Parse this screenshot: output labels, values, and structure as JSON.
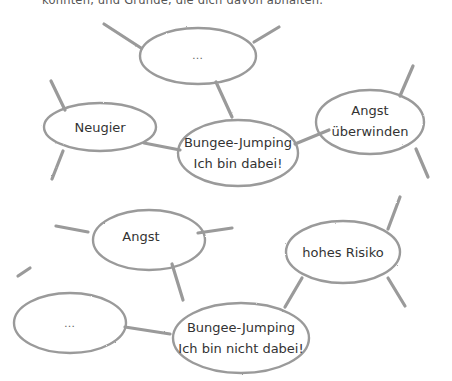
{
  "intro_text": "könnten, und Gründe, die dich davon abhalten.",
  "stroke_color": "#9a9a9a",
  "diagrams": [
    {
      "name": "dabei",
      "center": {
        "id": "center-1",
        "lines": [
          "Bungee-Jumping",
          "Ich bin dabei!"
        ]
      },
      "nodes": [
        {
          "id": "top",
          "text": "…"
        },
        {
          "id": "left",
          "text": "Neugier"
        },
        {
          "id": "right",
          "lines": [
            "Angst",
            "überwinden"
          ]
        }
      ]
    },
    {
      "name": "nicht-dabei",
      "center": {
        "id": "center-2",
        "lines": [
          "Bungee-Jumping",
          "Ich bin nicht dabei!"
        ]
      },
      "nodes": [
        {
          "id": "top",
          "text": "Angst"
        },
        {
          "id": "right",
          "text": "hohes Risiko"
        },
        {
          "id": "left",
          "text": "…"
        }
      ]
    }
  ]
}
